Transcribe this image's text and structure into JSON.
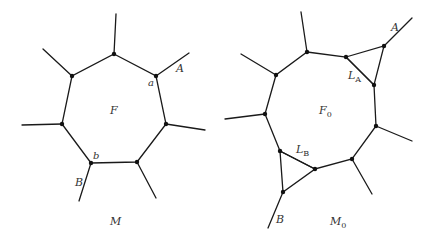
{
  "left_figure": {
    "caption": "M",
    "face_label": "F",
    "vertex_a_label": "a",
    "vertex_b_label": "b",
    "edge_A_label": "A",
    "edge_B_label": "B",
    "polygon_sides": 7
  },
  "right_figure": {
    "caption": "M",
    "caption_sub": "0",
    "face_label": "F",
    "face_sub": "0",
    "triangle_A_label": "L",
    "triangle_A_sub": "A",
    "triangle_B_label": "L",
    "triangle_B_sub": "B",
    "edge_A_label": "A",
    "edge_B_label": "B",
    "polygon_sides": 9
  }
}
